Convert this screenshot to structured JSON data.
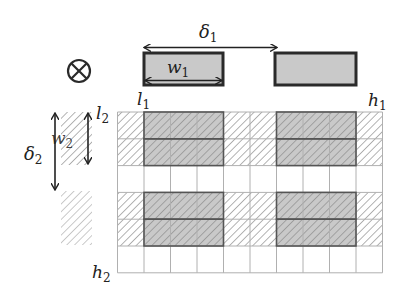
{
  "diagram": {
    "symbol": "⊗",
    "labels": {
      "delta1": {
        "base": "δ",
        "sub": "1"
      },
      "w1": {
        "base": "w",
        "sub": "1"
      },
      "l1": {
        "base": "l",
        "sub": "1"
      },
      "h1": {
        "base": "h",
        "sub": "1"
      },
      "l2": {
        "base": "l",
        "sub": "2"
      },
      "w2": {
        "base": "w",
        "sub": "2"
      },
      "delta2": {
        "base": "δ",
        "sub": "2"
      },
      "h2": {
        "base": "h",
        "sub": "2"
      }
    },
    "grid": {
      "columns": 10,
      "rows": 6,
      "row_types": [
        "hatched",
        "hatched",
        "empty",
        "hatched",
        "hatched",
        "empty"
      ],
      "column_types": [
        "light",
        "dark",
        "dark",
        "dark",
        "light",
        "light",
        "dark",
        "dark",
        "dark",
        "light"
      ]
    },
    "colors": {
      "rect_fill": "#c9c9c9",
      "rect_stroke": "#2a2a2a",
      "grid_line": "#b0b0b0",
      "hatch": "#888888",
      "arrow": "#222222"
    }
  }
}
